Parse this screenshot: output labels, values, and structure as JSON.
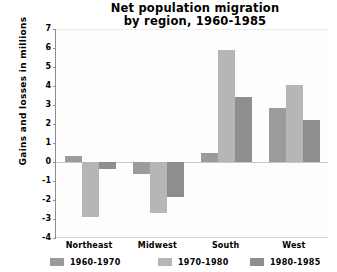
{
  "chart_data": {
    "type": "bar",
    "title": "Net population migration by region, 1960-1985",
    "title_lines": [
      "Net population migration",
      "by region, 1960-1985"
    ],
    "xlabel": "",
    "ylabel": "Gains and losses in millions",
    "ylim": [
      -4,
      7
    ],
    "ytick_labels": [
      "7",
      "6",
      "5",
      "4",
      "3",
      "2",
      "1",
      "0",
      "-1",
      "-2",
      "-3",
      "-4"
    ],
    "ytick_values": [
      7,
      6,
      5,
      4,
      3,
      2,
      1,
      0,
      -1,
      -2,
      -3,
      -4
    ],
    "grid": false,
    "legend_position": "bottom",
    "categories": [
      "Northeast",
      "Midwest",
      "South",
      "West"
    ],
    "series": [
      {
        "name": "1960-1970",
        "color": "#9b9b9b",
        "values": [
          0.3,
          -0.65,
          0.45,
          2.85
        ]
      },
      {
        "name": "1970-1980",
        "color": "#b6b6b6",
        "values": [
          -2.9,
          -2.7,
          5.9,
          4.05
        ]
      },
      {
        "name": "1980-1985",
        "color": "#8e8e8e",
        "values": [
          -0.35,
          -1.85,
          3.4,
          2.2
        ]
      }
    ]
  }
}
